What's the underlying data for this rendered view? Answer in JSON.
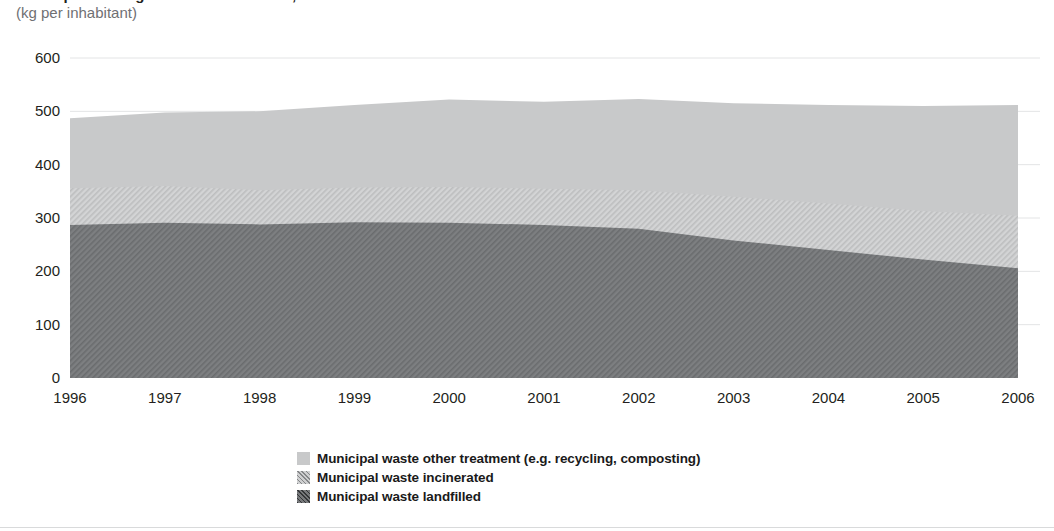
{
  "header": {
    "title": "Municipal waste generated and treated, EU-27",
    "subtitle": "(kg per inhabitant)"
  },
  "legend": {
    "position": "bottom-center",
    "items": [
      {
        "label": "Municipal waste other treatment (e.g. recycling, composting)",
        "swatch": "sw-other",
        "icon": "legend-swatch-solid-light-gray"
      },
      {
        "label": "Municipal waste incinerated",
        "swatch": "sw-incin",
        "icon": "legend-swatch-hatched-light-gray"
      },
      {
        "label": "Municipal waste landfilled",
        "swatch": "sw-land",
        "icon": "legend-swatch-hatched-dark-gray"
      }
    ]
  },
  "colors": {
    "other_treatment": "#c8c9ca",
    "incinerated": "#cfd0d1",
    "landfilled": "#77797b",
    "gridline": "#e3e4e5",
    "axis_text": "#231f20",
    "subtitle_text": "#6f7073"
  },
  "chart_data": {
    "type": "area",
    "stacked": true,
    "title": "Municipal waste generated and treated, EU-27",
    "subtitle": "(kg per inhabitant)",
    "xlabel": "",
    "ylabel": "(kg per inhabitant)",
    "x": [
      1996,
      1997,
      1998,
      1999,
      2000,
      2001,
      2002,
      2003,
      2004,
      2005,
      2006
    ],
    "xtick_labels": [
      "1996",
      "1997",
      "1998",
      "1999",
      "2000",
      "2001",
      "2002",
      "2003",
      "2004",
      "2005",
      "2006"
    ],
    "ytick_labels": [
      "0",
      "100",
      "200",
      "300",
      "400",
      "500",
      "600"
    ],
    "yticks": [
      0,
      100,
      200,
      300,
      400,
      500,
      600
    ],
    "ylim": [
      0,
      600
    ],
    "xlim": [
      1996,
      2006
    ],
    "grid": true,
    "grid_axis": "y",
    "series": [
      {
        "name": "Municipal waste landfilled",
        "color": "#77797b",
        "pattern": "diagonal-hatch",
        "values": [
          287,
          291,
          288,
          292,
          291,
          287,
          280,
          258,
          240,
          222,
          206
        ]
      },
      {
        "name": "Municipal waste incinerated",
        "color": "#cfd0d1",
        "pattern": "diagonal-hatch",
        "values": [
          69,
          69,
          64,
          65,
          67,
          68,
          72,
          82,
          87,
          91,
          98
        ]
      },
      {
        "name": "Municipal waste other treatment (e.g. recycling, composting)",
        "color": "#c8c9ca",
        "pattern": "solid",
        "values": [
          131,
          138,
          148,
          155,
          164,
          163,
          171,
          175,
          185,
          197,
          208
        ]
      }
    ],
    "cumulative_tops": {
      "landfilled": [
        287,
        291,
        288,
        292,
        291,
        287,
        280,
        258,
        240,
        222,
        206
      ],
      "incinerated": [
        356,
        360,
        352,
        357,
        358,
        355,
        352,
        340,
        327,
        313,
        304
      ],
      "total": [
        487,
        498,
        500,
        512,
        522,
        518,
        523,
        515,
        512,
        510,
        512
      ]
    }
  }
}
